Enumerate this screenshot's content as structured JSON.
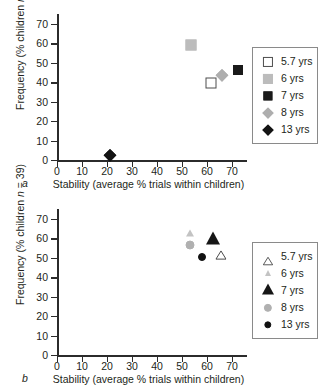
{
  "figure": {
    "axis_color": "#2b2b2b",
    "background": "#ffffff"
  },
  "chart_data": [
    {
      "type": "scatter",
      "panel": "a",
      "title": "",
      "xlabel": "Stability (average % trials within children)",
      "ylabel": "Frequency (% children n = 39)",
      "xlim": [
        0,
        76
      ],
      "ylim": [
        0,
        74
      ],
      "xticks": [
        0,
        10,
        20,
        30,
        40,
        50,
        60,
        70
      ],
      "yticks": [
        0,
        10,
        20,
        30,
        40,
        50,
        60,
        70
      ],
      "grid": false,
      "legend_position": "right",
      "series": [
        {
          "name": "5.7 yrs",
          "marker": "square",
          "fill": "#ffffff",
          "edge": "#4d4d4d",
          "size": 11,
          "x": 61.5,
          "y": 39.5
        },
        {
          "name": "6 yrs",
          "marker": "square",
          "fill": "#bcbcbc",
          "edge": "#bcbcbc",
          "size": 11,
          "x": 53.5,
          "y": 59.0
        },
        {
          "name": "7 yrs",
          "marker": "square",
          "fill": "#1a1a1a",
          "edge": "#1a1a1a",
          "size": 10,
          "x": 72.5,
          "y": 46.5
        },
        {
          "name": "8 yrs",
          "marker": "diamond",
          "fill": "#aeaeae",
          "edge": "#aeaeae",
          "size": 11,
          "x": 66.0,
          "y": 43.5
        },
        {
          "name": "13 yrs",
          "marker": "diamond",
          "fill": "#141414",
          "edge": "#141414",
          "size": 11,
          "x": 21.0,
          "y": 2.5
        }
      ]
    },
    {
      "type": "scatter",
      "panel": "b",
      "title": "",
      "xlabel": "Stability (average % trials within children)",
      "ylabel": "Frequency (% children n = 39)",
      "xlim": [
        0,
        76
      ],
      "ylim": [
        0,
        74
      ],
      "xticks": [
        0,
        10,
        20,
        30,
        40,
        50,
        60,
        70
      ],
      "yticks": [
        0,
        10,
        20,
        30,
        40,
        50,
        60,
        70
      ],
      "grid": false,
      "legend_position": "right",
      "series": [
        {
          "name": "5.7 yrs",
          "marker": "triangle-open",
          "fill": "#ffffff",
          "edge": "#3d3d3d",
          "size": 10,
          "x": 65.5,
          "y": 53.5
        },
        {
          "name": "6 yrs",
          "marker": "triangle",
          "fill": "#c3c3c3",
          "edge": "#c3c3c3",
          "size": 7,
          "x": 53.0,
          "y": 62.5
        },
        {
          "name": "7 yrs",
          "marker": "triangle",
          "fill": "#161616",
          "edge": "#161616",
          "size": 13,
          "x": 62.5,
          "y": 59.5
        },
        {
          "name": "8 yrs",
          "marker": "circle",
          "fill": "#b0b0b0",
          "edge": "#b0b0b0",
          "size": 9,
          "x": 53.0,
          "y": 56.5
        },
        {
          "name": "13 yrs",
          "marker": "circle",
          "fill": "#111111",
          "edge": "#111111",
          "size": 8,
          "x": 58.0,
          "y": 50.5
        }
      ]
    }
  ],
  "panels": [
    {
      "letter": "a"
    },
    {
      "letter": "b"
    }
  ]
}
